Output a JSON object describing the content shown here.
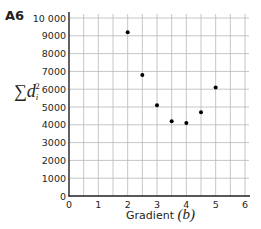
{
  "figure": {
    "label": "A6",
    "ylabel_sigma": "∑",
    "ylabel_var": "d",
    "ylabel_sub": "i",
    "ylabel_sup": "2",
    "xlabel_text": "Gradient ",
    "xlabel_var": "(b)"
  },
  "chart_data": {
    "type": "scatter",
    "title": "",
    "xlabel": "Gradient (b)",
    "ylabel": "∑d_i^2",
    "xlim": [
      0,
      6
    ],
    "ylim": [
      0,
      10000
    ],
    "grid": true,
    "x_ticks": [
      "0",
      "1",
      "2",
      "3",
      "4",
      "5",
      "6"
    ],
    "y_ticks": [
      "0",
      "1000",
      "2000",
      "3000",
      "4000",
      "5000",
      "6000",
      "7000",
      "8000",
      "9000",
      "10 000"
    ],
    "points": [
      {
        "x": 2.0,
        "y": 9200
      },
      {
        "x": 2.5,
        "y": 6800
      },
      {
        "x": 3.0,
        "y": 5100
      },
      {
        "x": 3.5,
        "y": 4200
      },
      {
        "x": 4.0,
        "y": 4100
      },
      {
        "x": 4.5,
        "y": 4700
      },
      {
        "x": 5.0,
        "y": 6100
      }
    ],
    "legend": null
  }
}
